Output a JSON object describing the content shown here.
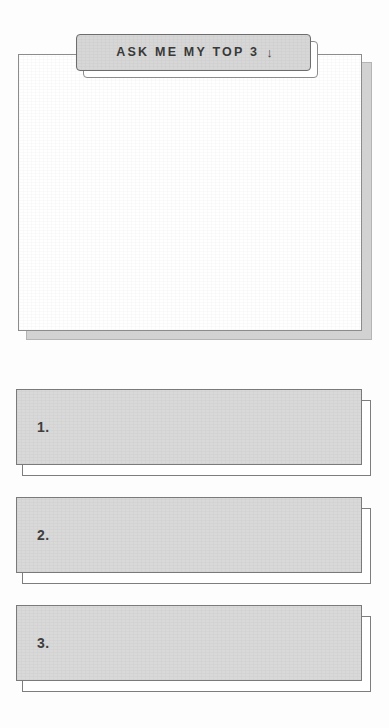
{
  "page": {
    "background_color": "#fdfdfd",
    "width": 389,
    "height": 728
  },
  "header": {
    "label": "ASK ME MY TOP 3",
    "arrow_icon": "arrow-down-icon",
    "arrow_glyph": "↓",
    "fill_color": "#d7d7d7",
    "border_color": "#6d6d6d",
    "text_color": "#3a3a3a"
  },
  "note_card": {
    "name": "question-note-card",
    "fill_color": "#ffffff",
    "border_color": "#8c8c8c",
    "shadow_color": "#d2d2d2",
    "content": ""
  },
  "answers": {
    "fill_color": "#d9d9d9",
    "border_color": "#7a7a7a",
    "number_color": "#3f3f3f",
    "items": [
      {
        "number": "1.",
        "text": ""
      },
      {
        "number": "2.",
        "text": ""
      },
      {
        "number": "3.",
        "text": ""
      }
    ]
  }
}
